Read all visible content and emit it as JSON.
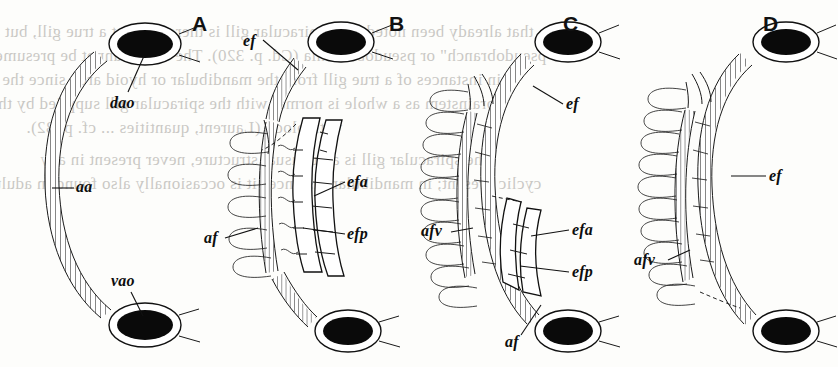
{
  "figure": {
    "kind": "anatomical-line-drawing",
    "background_color": "#fdfdfb",
    "ink_color": "#111111",
    "panels": [
      {
        "id": "A",
        "letter": "A",
        "labels": [
          {
            "key": "dao",
            "text": "dao",
            "meaning": "dorsal aorta"
          },
          {
            "key": "aa",
            "text": "aa",
            "meaning": "afferent artery"
          },
          {
            "key": "vao",
            "text": "vao",
            "meaning": "ventral aorta"
          }
        ]
      },
      {
        "id": "B",
        "letter": "B",
        "labels": [
          {
            "key": "ef",
            "text": "ef",
            "meaning": "efferent filament vessel"
          },
          {
            "key": "efa",
            "text": "efa",
            "meaning": "efferent filament artery anterior"
          },
          {
            "key": "efp",
            "text": "efp",
            "meaning": "efferent filament artery posterior"
          },
          {
            "key": "af",
            "text": "af",
            "meaning": "afferent filament artery"
          }
        ]
      },
      {
        "id": "C",
        "letter": "C",
        "labels": [
          {
            "key": "ef",
            "text": "ef",
            "meaning": "efferent filament vessel"
          },
          {
            "key": "afv",
            "text": "afv",
            "meaning": "afferent filament vessel"
          },
          {
            "key": "efa",
            "text": "efa",
            "meaning": "efferent filament artery anterior"
          },
          {
            "key": "efp",
            "text": "efp",
            "meaning": "efferent filament artery posterior"
          },
          {
            "key": "af",
            "text": "af",
            "meaning": "afferent filament artery"
          }
        ]
      },
      {
        "id": "D",
        "letter": "D",
        "labels": [
          {
            "key": "ef",
            "text": "ef",
            "meaning": "efferent filament vessel"
          },
          {
            "key": "afv",
            "text": "afv",
            "meaning": "afferent filament vessel"
          }
        ]
      }
    ]
  },
  "bleed_through": {
    "note": "faint mirrored text showing through from the reverse side of the page",
    "lines": [
      "that already been noted. The spiracular gill is therefore not a true gill, but a",
      "\"pseudobranch\" or pseudobranchia (Cd. p. 320). The same cannot be presumed",
      "in instances of a true gill from the mandibular or hyoid arch since the",
      "brainstem as a whole is normal with the spiracular gill supplied by the",
      "with blood (Laurent, quantities ... cf. p. 32).",
      "The spiracular gill is an unusual structure, never present in any",
      "cyclic present; in mandibular instances it is occasionally also found in adult"
    ]
  }
}
